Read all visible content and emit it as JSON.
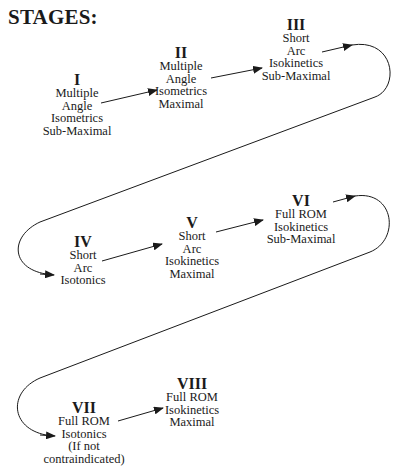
{
  "title": "STAGES:",
  "stages": [
    {
      "numeral": "I",
      "lines": [
        "Multiple",
        "Angle",
        "Isometrics",
        "Sub-Maximal"
      ]
    },
    {
      "numeral": "II",
      "lines": [
        "Multiple",
        "Angle",
        "Isometrics",
        "Maximal"
      ]
    },
    {
      "numeral": "III",
      "lines": [
        "Short",
        "Arc",
        "Isokinetics",
        "Sub-Maximal"
      ]
    },
    {
      "numeral": "IV",
      "lines": [
        "Short",
        "Arc",
        "Isotonics"
      ]
    },
    {
      "numeral": "V",
      "lines": [
        "Short",
        "Arc",
        "Isokinetics",
        "Maximal"
      ]
    },
    {
      "numeral": "VI",
      "lines": [
        "Full ROM",
        "Isokinetics",
        "Sub-Maximal"
      ]
    },
    {
      "numeral": "VII",
      "lines": [
        "Full ROM",
        "Isotonics",
        "(If not",
        "contraindicated)"
      ]
    },
    {
      "numeral": "VIII",
      "lines": [
        "Full ROM",
        "Isokinetics",
        "Maximal"
      ]
    }
  ],
  "connections": [
    {
      "from": "I",
      "to": "II"
    },
    {
      "from": "II",
      "to": "III"
    },
    {
      "from": "III",
      "to": "IV"
    },
    {
      "from": "IV",
      "to": "V"
    },
    {
      "from": "V",
      "to": "VI"
    },
    {
      "from": "VI",
      "to": "VII"
    },
    {
      "from": "VII",
      "to": "VIII"
    }
  ]
}
